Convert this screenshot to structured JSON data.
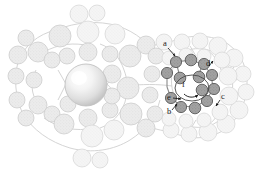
{
  "figure": {
    "background_color": "#ffffff"
  },
  "palette": {
    "background": "#ffffff",
    "sphere_light_fill": "#e9e9e9",
    "sphere_light_stroke": "#c9c9c9",
    "sphere_pale_fill": "#f2f2f2",
    "sphere_pale_stroke": "#d8d8d8",
    "sphere_dark_fill": "#9a9a9a",
    "sphere_dark_stroke": "#5a5a5a",
    "bond_stroke": "#cfcfcf",
    "bond_stroke_dark": "#8a8a8a",
    "label_color": "#1a1a1a",
    "arrow_color": "#111111",
    "center_sphere_highlight": "#ffffff",
    "center_sphere_mid": "#e2e2e2",
    "center_sphere_edge": "#b9b9b9"
  },
  "labels": [
    {
      "id": "a",
      "text": "a",
      "x": 166,
      "y": 46,
      "tip_x": 176,
      "tip_y": 57
    },
    {
      "id": "b",
      "text": "b",
      "x": 170,
      "y": 112,
      "tip_x": 177,
      "tip_y": 104
    },
    {
      "id": "c",
      "text": "c",
      "x": 221,
      "y": 98,
      "tip_x": 216,
      "tip_y": 106
    },
    {
      "id": "d",
      "text": "d",
      "x": 208,
      "y": 68,
      "tip_x": 213,
      "tip_y": 62
    },
    {
      "id": "e",
      "text": "e",
      "x": 170,
      "y": 99,
      "tip_x": 181,
      "tip_y": 100
    },
    {
      "id": "f",
      "text": "f",
      "x": 183,
      "y": 86,
      "tip_x": 191,
      "tip_y": 92
    }
  ],
  "center_sphere": {
    "name": "central-guest-ion",
    "cx": 86,
    "cy": 85,
    "r": 21
  },
  "rotation_arrow": {
    "name": "rotation-indicator",
    "cx": 192,
    "cy": 88,
    "rx": 17,
    "ry": 13
  },
  "highlight_ring": {
    "name": "highlighted-macrocycle",
    "atom_count": 12,
    "cx": 192,
    "cy": 88
  },
  "counts": {
    "light_spheres": 56,
    "dark_spheres": 12,
    "annotated_positions": 6
  }
}
